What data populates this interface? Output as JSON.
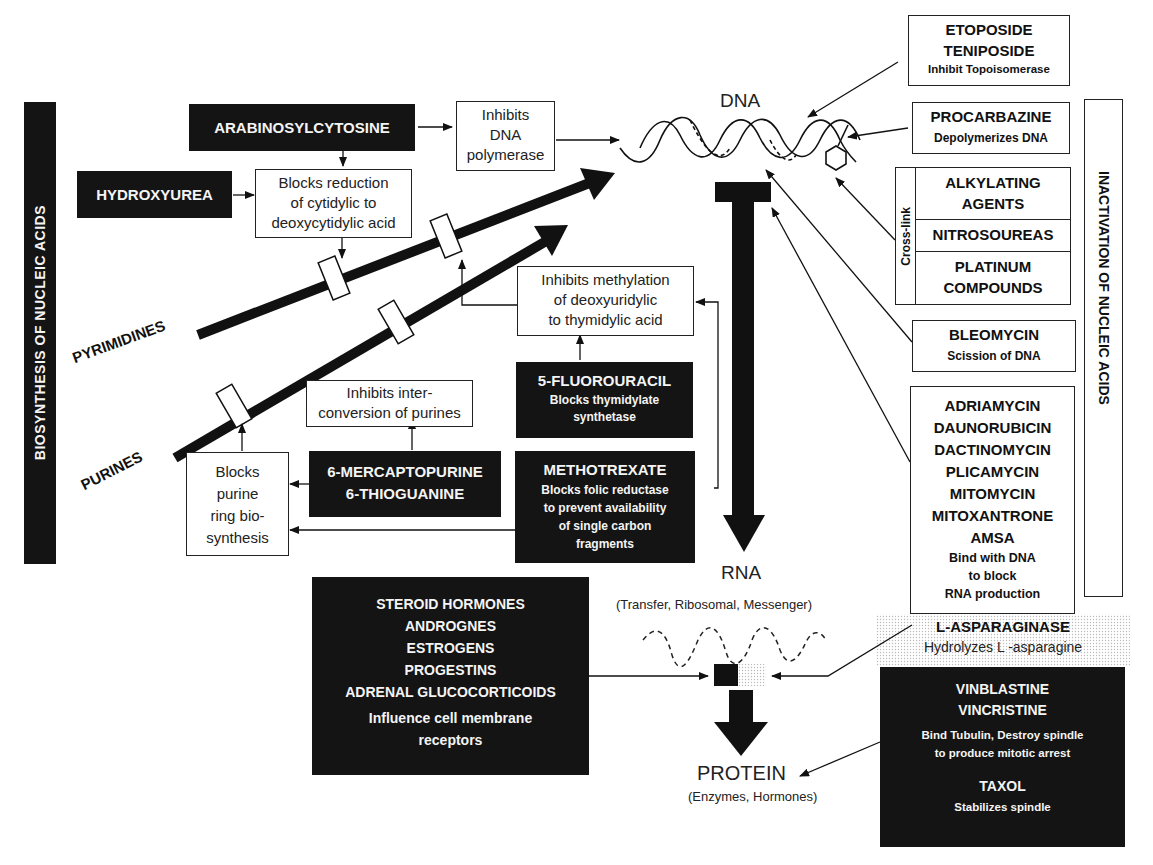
{
  "colors": {
    "ink": "#141414",
    "paper": "#ffffff",
    "stipple": "#d8d8d8"
  },
  "side_labels": {
    "left": "BIOSYNTHESIS OF NUCLEIC ACIDS",
    "right": "INACTIVATION OF NUCLEIC ACIDS"
  },
  "pathways": {
    "pyrimidines": "PYRIMIDINES",
    "purines": "PURINES"
  },
  "central": {
    "dna": "DNA",
    "rna": "RNA",
    "rna_sub": "(Transfer, Ribosomal, Messenger)",
    "protein": "PROTEIN",
    "protein_sub": "(Enzymes, Hormones)"
  },
  "drugs": {
    "arabinosylcytosine": "ARABINOSYLCYTOSINE",
    "hydroxyurea": "HYDROXYUREA",
    "fluorouracil": {
      "name": "5-FLUOROURACIL",
      "action": [
        "Blocks thymidylate",
        "synthetase"
      ]
    },
    "mercaptopurine": {
      "names": [
        "6-MERCAPTOPURINE",
        "6-THIOGUANINE"
      ]
    },
    "methotrexate": {
      "name": "METHOTREXATE",
      "action": [
        "Blocks folic reductase",
        "to prevent availability",
        "of single carbon",
        "fragments"
      ]
    },
    "steroids": {
      "names": [
        "STEROID HORMONES",
        "ANDROGNES",
        "ESTROGENS",
        "PROGESTINS",
        "ADRENAL GLUCOCORTICOIDS"
      ],
      "action": [
        "Influence cell membrane",
        "receptors"
      ]
    },
    "etoposide": {
      "names": [
        "ETOPOSIDE",
        "TENIPOSIDE"
      ],
      "action": "Inhibit Topoisomerase"
    },
    "procarbazine": {
      "name": "PROCARBAZINE",
      "action": "Depolymerizes DNA"
    },
    "crosslink": {
      "label": "Cross-link",
      "groups": [
        [
          "ALKYLATING",
          "AGENTS"
        ],
        [
          "NITROSOUREAS"
        ],
        [
          "PLATINUM",
          "COMPOUNDS"
        ]
      ]
    },
    "bleomycin": {
      "name": "BLEOMYCIN",
      "action": "Scission of DNA"
    },
    "antibiotics": {
      "names": [
        "ADRIAMYCIN",
        "DAUNORUBICIN",
        "DACTINOMYCIN",
        "PLICAMYCIN",
        "MITOMYCIN",
        "MITOXANTRONE",
        "AMSA"
      ],
      "action": [
        "Bind with DNA",
        "to block",
        "RNA production"
      ]
    },
    "asparaginase": {
      "name": "L-ASPARAGINASE",
      "action": "Hydrolyzes L  -asparagine"
    },
    "vinca": {
      "names": [
        "VINBLASTINE",
        "VINCRISTINE"
      ],
      "action": [
        "Bind Tubulin, Destroy spindle",
        "to produce mitotic arrest"
      ],
      "taxol": "TAXOL",
      "taxol_action": "Stabilizes spindle"
    }
  },
  "mechanisms": {
    "dna_polymerase": [
      "Inhibits",
      "DNA",
      "polymerase"
    ],
    "cytidylic": [
      "Blocks reduction",
      "of cytidylic to",
      "deoxycytidylic acid"
    ],
    "methylation": [
      "Inhibits methylation",
      "of deoxyuridylic",
      "to thymidylic acid"
    ],
    "interconversion": [
      "Inhibits inter-",
      "conversion  of purines"
    ],
    "purine_ring": [
      "Blocks",
      "purine",
      "ring bio-",
      "synthesis"
    ]
  }
}
